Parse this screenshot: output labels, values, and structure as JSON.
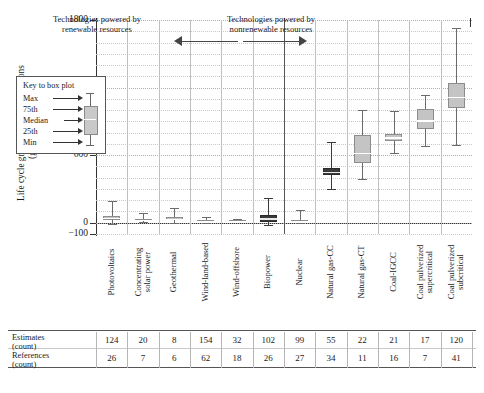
{
  "chart_data": {
    "type": "box",
    "title": "",
    "ylabel_line1": "Life cycle greenhouse gas emissions",
    "ylabel_line2": "(gCO₂e/kWh)",
    "xlabel": "",
    "ylim": [
      -100,
      1800
    ],
    "yticks": [
      1800,
      1200,
      600,
      0,
      -100
    ],
    "ytick_labels": [
      "1800",
      "1200",
      "600",
      "0",
      "−100"
    ],
    "grid": true,
    "annotations": [
      {
        "name": "renewable-group",
        "text_line1": "Technologies powered by",
        "text_line2": "renewable resources"
      },
      {
        "name": "nonrenewable-group",
        "text_line1": "Technologies powered by",
        "text_line2": "nonrenewable resources"
      }
    ],
    "legend": {
      "title": "Key to box plot",
      "items": [
        "Max",
        "75th",
        "Median",
        "25th",
        "Min"
      ]
    },
    "categories": [
      "Photovoltaics",
      "Concentrating solar power",
      "Geothermal",
      "Wind-land-based",
      "Wind-offshore",
      "Biopower",
      "Nuclear",
      "Natural gas-CC",
      "Natural gas-CT",
      "Coal-IGCC",
      "Coal pulverized supercritical",
      "Coal pulverized subcritical"
    ],
    "boxes": [
      {
        "category": "Photovoltaics",
        "min": -10,
        "q1": 20,
        "median": 43,
        "q3": 60,
        "max": 190,
        "group": "renewable",
        "fill": "light"
      },
      {
        "category": "Concentrating solar power",
        "min": 5,
        "q1": 18,
        "median": 26,
        "q3": 35,
        "max": 90,
        "group": "renewable",
        "fill": "light"
      },
      {
        "category": "Geothermal",
        "min": 2,
        "q1": 20,
        "median": 37,
        "q3": 53,
        "max": 130,
        "group": "renewable",
        "fill": "light"
      },
      {
        "category": "Wind-land-based",
        "min": 2,
        "q1": 8,
        "median": 12,
        "q3": 20,
        "max": 55,
        "group": "renewable",
        "fill": "light"
      },
      {
        "category": "Wind-offshore",
        "min": 6,
        "q1": 9,
        "median": 12,
        "q3": 23,
        "max": 35,
        "group": "renewable",
        "fill": "light"
      },
      {
        "category": "Biopower",
        "min": -20,
        "q1": 8,
        "median": 40,
        "q3": 70,
        "max": 220,
        "group": "renewable",
        "fill": "dark"
      },
      {
        "category": "Nuclear",
        "min": 1,
        "q1": 8,
        "median": 13,
        "q3": 22,
        "max": 110,
        "group": "nonrenewable",
        "fill": "light"
      },
      {
        "category": "Natural gas-CC",
        "min": 300,
        "q1": 420,
        "median": 450,
        "q3": 490,
        "max": 720,
        "group": "nonrenewable",
        "fill": "dark"
      },
      {
        "category": "Natural gas-CT",
        "min": 390,
        "q1": 530,
        "median": 620,
        "q3": 780,
        "max": 1000,
        "group": "nonrenewable",
        "fill": "light"
      },
      {
        "category": "Coal-IGCC",
        "min": 620,
        "q1": 730,
        "median": 760,
        "q3": 790,
        "max": 990,
        "group": "nonrenewable",
        "fill": "light"
      },
      {
        "category": "Coal pulverized supercritical",
        "min": 680,
        "q1": 830,
        "median": 910,
        "q3": 1010,
        "max": 1130,
        "group": "nonrenewable",
        "fill": "light"
      },
      {
        "category": "Coal pulverized subcritical",
        "min": 690,
        "q1": 1020,
        "median": 1120,
        "q3": 1240,
        "max": 1730,
        "group": "nonrenewable",
        "fill": "light"
      }
    ]
  },
  "table": {
    "rows": [
      {
        "label_line1": "Estimates",
        "label_line2": "(count)",
        "values": [
          "124",
          "20",
          "8",
          "154",
          "32",
          "102",
          "99",
          "55",
          "22",
          "21",
          "17",
          "120"
        ]
      },
      {
        "label_line1": "References",
        "label_line2": "(count)",
        "values": [
          "26",
          "7",
          "6",
          "62",
          "18",
          "26",
          "27",
          "34",
          "11",
          "16",
          "7",
          "41"
        ]
      }
    ]
  }
}
